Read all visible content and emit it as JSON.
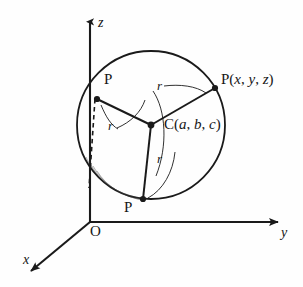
{
  "figure": {
    "background_color": "#fefefe",
    "stroke_color": "#1a1a1a"
  },
  "axes": {
    "z_label": "z",
    "y_label": "y",
    "x_label": "x",
    "origin_label": "O"
  },
  "labels": {
    "point_upper_left": "P",
    "point_bottom": "P",
    "point_right_name": "P",
    "point_right_open": "(",
    "point_right_x": "x",
    "point_right_comma1": ", ",
    "point_right_y": "y",
    "point_right_comma2": ", ",
    "point_right_z": "z",
    "point_right_close": ")",
    "center_name": "C",
    "center_open": "(",
    "center_a": "a",
    "center_comma1": ", ",
    "center_b": "b",
    "center_comma2": ", ",
    "center_c": "c",
    "center_close": ")",
    "radius_top": "r",
    "radius_left": "r",
    "radius_bottom": "r"
  },
  "geometry": {
    "circle_center_x": 151,
    "circle_center_y": 125,
    "circle_radius": 74,
    "center_point_x": 151,
    "center_point_y": 125,
    "point_upper_left_x": 97,
    "point_upper_left_y": 99,
    "point_right_x": 215,
    "point_right_y": 88,
    "point_bottom_x": 143,
    "point_bottom_y": 199,
    "origin_x": 90,
    "origin_y": 222,
    "z_axis_top_y": 16,
    "y_axis_right_x": 285,
    "x_axis_end_x": 24,
    "x_axis_end_y": 277
  }
}
